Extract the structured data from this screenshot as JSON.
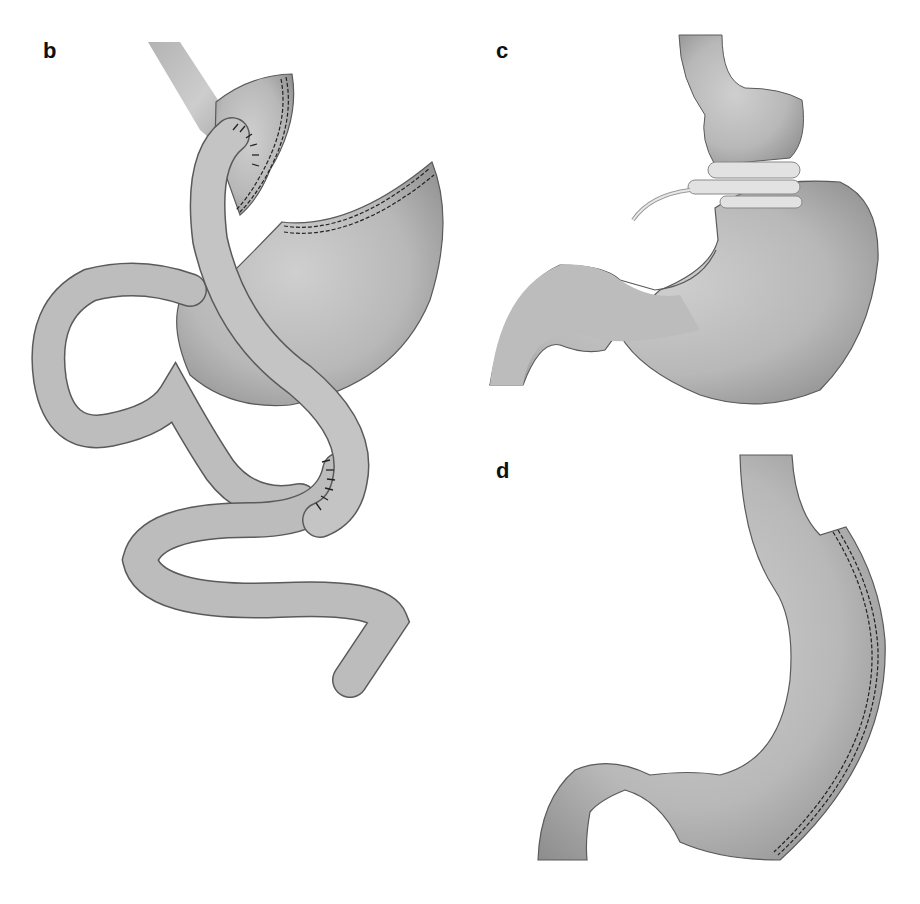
{
  "figure": {
    "panels": [
      {
        "label": "b",
        "description": "Roux-en-Y gastric bypass: small gastric pouch with stapled excluded remnant stomach, Roux limb anastomosed to pouch and jejunojejunostomy"
      },
      {
        "label": "c",
        "description": "Adjustable gastric band placed around upper stomach with connecting tube"
      },
      {
        "label": "d",
        "description": "Sleeve gastrectomy: tubular stomach with staple line along greater curvature"
      }
    ]
  },
  "colors": {
    "organ_fill_light": "#c8c8c8",
    "organ_fill_dark": "#8f8f8f",
    "outline": "#5a5a5a",
    "staple": "#222222",
    "band": "#e2e2e2",
    "background": "#ffffff"
  }
}
